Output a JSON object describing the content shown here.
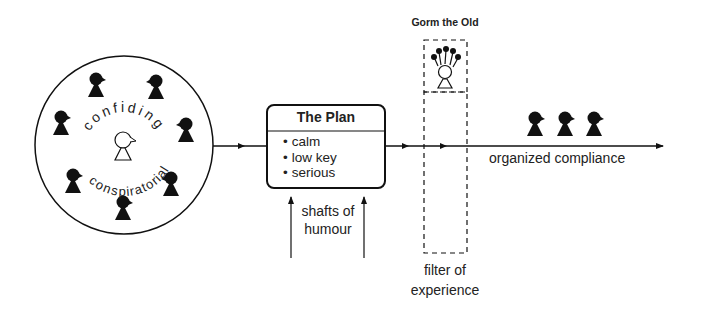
{
  "diagram": {
    "group_circle": {
      "top_label": "confiding",
      "bottom_label": "conspiratorial",
      "member_count": 8,
      "center_figure": "leader"
    },
    "plan_box": {
      "title": "The Plan",
      "items": [
        "calm",
        "low key",
        "serious"
      ]
    },
    "inputs": {
      "label": "shafts of humour"
    },
    "gorm": {
      "label": "Gorm the Old"
    },
    "filter": {
      "label": "filter of experience"
    },
    "outcome": {
      "label": "organized compliance",
      "figure_count": 3
    },
    "colors": {
      "ink": "#111111",
      "text": "#222222",
      "background": "#ffffff"
    }
  }
}
